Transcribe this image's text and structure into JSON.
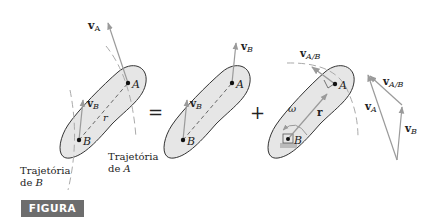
{
  "figure": {
    "badge": "FIGURA 5/6",
    "colors": {
      "body_fill": "#e6e6e6",
      "outline": "#333333",
      "vector": "#9a9a9a",
      "badge_bg": "#6d6d6d",
      "badge_text": "#ffffff"
    }
  },
  "panel1": {
    "label_vA": "v",
    "label_vA_sub": "A",
    "label_vB": "v",
    "label_vB_sub": "B",
    "point_A": "A",
    "point_B": "B",
    "label_r": "r",
    "path_A_line1": "Trajetória",
    "path_A_line2_prefix": "de ",
    "path_A_line2_var": "A",
    "path_B_line1": "Trajetória",
    "path_B_line2_prefix": "de ",
    "path_B_line2_var": "B"
  },
  "operators": {
    "equals": "=",
    "plus": "+"
  },
  "panel2": {
    "label_vB_at_A": "v",
    "label_vB_at_A_sub": "B",
    "label_vB_at_B": "v",
    "label_vB_at_B_sub": "B",
    "point_A": "A",
    "point_B": "B"
  },
  "panel3": {
    "label_vAB": "v",
    "label_vAB_sub": "A/B",
    "label_omega": "ω",
    "label_r": "r",
    "point_A": "A",
    "point_B": "B"
  },
  "vector_triangle": {
    "label_vAB": "v",
    "label_vAB_sub": "A/B",
    "label_vA": "v",
    "label_vA_sub": "A",
    "label_vB": "v",
    "label_vB_sub": "B"
  }
}
